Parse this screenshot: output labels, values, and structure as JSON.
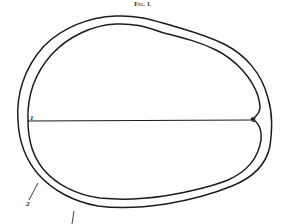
{
  "figure": {
    "title": "Fig. I.",
    "labels": {
      "left_point": "1",
      "right_point": "2",
      "pointer_label": "2"
    },
    "colors": {
      "ink": "#1c1c1c",
      "paper": "#ffffff"
    }
  }
}
